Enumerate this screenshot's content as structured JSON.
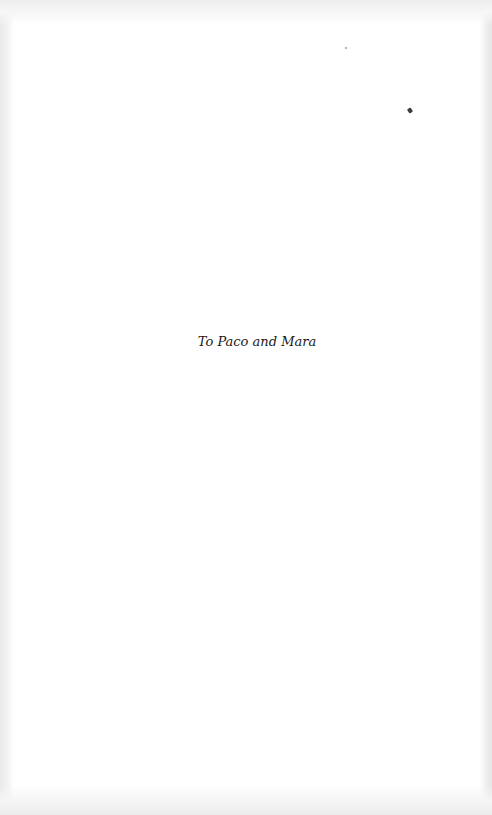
{
  "page": {
    "dedication": "To Paco and Mara"
  }
}
